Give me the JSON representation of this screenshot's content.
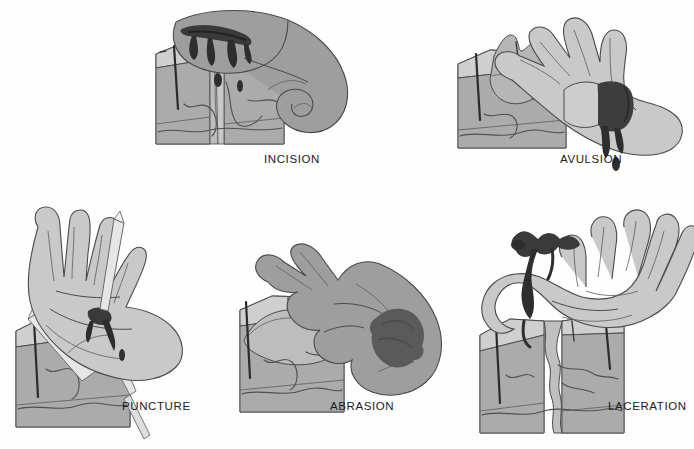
{
  "figure": {
    "background_color": "#ffffff",
    "style": "grayscale medical illustration",
    "panel_count": 5
  },
  "palette": {
    "skin_light": "#c9c9c9",
    "skin_mid": "#b4b4b4",
    "skin_dark": "#9a9a9a",
    "hand_shaded": "#9e9e9e",
    "hand_shaded_dark": "#8b8b8b",
    "dermis": "#a8a8a8",
    "epidermis": "#c4c4c4",
    "subcutis": "#b0b0b0",
    "block_top": "#cccccc",
    "block_side": "#b8b8b8",
    "wound_dark": "#3f3f3f",
    "blood": "#2e2e2e",
    "splinter": "#e2e2e2",
    "outline": "#4a4a4a",
    "text": "#1b1b1b"
  },
  "panels": [
    {
      "id": "incision",
      "label": "INCISION",
      "label_x": 264,
      "label_y": 153,
      "description": "Shaded hand with a clean straight cut and dripping blood, beside a skin cross-section block split by a sharp linear split",
      "hand_tone": "dark",
      "wound_type": "clean straight cut",
      "has_blood_drips": true,
      "has_splinter": false,
      "block_feature": "straight vertical split through epidermis and dermis"
    },
    {
      "id": "avulsion",
      "label": "AVULSION",
      "label_x": 560,
      "label_y": 153,
      "description": "Light hand with a torn flap of skin peeled back and blood beneath, beside a block with a raised torn skin flap",
      "hand_tone": "light",
      "wound_type": "torn flap of tissue",
      "has_blood_drips": true,
      "has_splinter": false,
      "block_feature": "skin flap lifted and folded away from the surface"
    },
    {
      "id": "puncture",
      "label": "PUNCTURE",
      "label_x": 122,
      "label_y": 400,
      "description": "Open light palm pierced by a pointed splinter with a small dark puncture wound, beside a block with the splinter driven deep into the dermis",
      "hand_tone": "light",
      "wound_type": "deep narrow hole",
      "has_blood_drips": true,
      "has_splinter": true,
      "block_feature": "splinter penetrating from top surface down into dermis"
    },
    {
      "id": "abrasion",
      "label": "ABRASION",
      "label_x": 330,
      "label_y": 400,
      "description": "Shaded back of hand with a dark scraped patch, beside a block showing a shallow scraped area removing the epidermis only",
      "hand_tone": "dark",
      "wound_type": "surface scrape",
      "has_blood_drips": false,
      "has_splinter": false,
      "block_feature": "shallow rounded scrape in the top layer only"
    },
    {
      "id": "laceration",
      "label": "LACERATION",
      "label_x": 608,
      "label_y": 400,
      "description": "Open light palm with a jagged irregular tear and blood, beside a block with a ragged deep split through the tissue layers",
      "hand_tone": "light",
      "wound_type": "jagged irregular tear",
      "has_blood_drips": true,
      "has_splinter": false,
      "block_feature": "ragged, wavy-edged split running deep through the block"
    }
  ]
}
